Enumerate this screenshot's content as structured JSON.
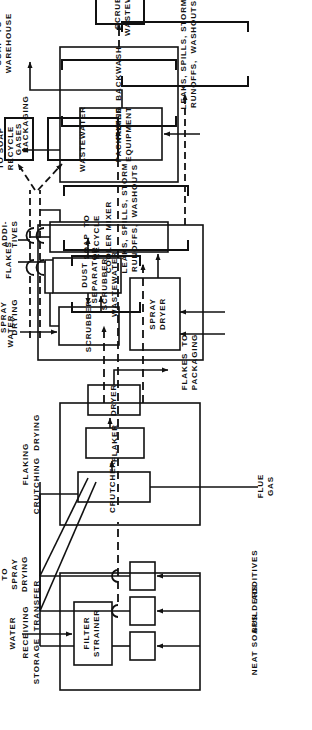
{
  "diagram": {
    "orientation": "rotated-90-ccw",
    "sections": [
      {
        "id": "receiving",
        "label": "RECEIVING\nSTORAGE  TRANSFER"
      },
      {
        "id": "flaking",
        "label": "FLAKING\nCRUTCHING  DRYING"
      },
      {
        "id": "spray",
        "label": "SPRAY\nDRYING"
      },
      {
        "id": "packaging",
        "label": "PACKAGING"
      }
    ],
    "units": [
      {
        "id": "filter-strainer",
        "label": "FILTER\nSTRAINER"
      },
      {
        "id": "tank-neat-soaps",
        "label": ""
      },
      {
        "id": "tank-builders",
        "label": ""
      },
      {
        "id": "tank-additives",
        "label": ""
      },
      {
        "id": "crutcher",
        "label": "CRUTCHER"
      },
      {
        "id": "flaker",
        "label": "FLAKER"
      },
      {
        "id": "dryer",
        "label": "DRYER"
      },
      {
        "id": "spray-dryer",
        "label": "SPRAY\nDRYER"
      },
      {
        "id": "scrubber",
        "label": "SCRUBBER"
      },
      {
        "id": "dust-separator",
        "label": "DUST\nSEPARATOR"
      },
      {
        "id": "cooler-mixer",
        "label": "COOLER MIXER"
      },
      {
        "id": "packaging-equipment",
        "label": "PACKAGING\nEQUIPMENT"
      }
    ],
    "waste_boxes": [
      {
        "id": "filter-backwash",
        "label": "FILTER  BACKWASH",
        "style": "bracket"
      },
      {
        "id": "scrubber-wastewater-flaking",
        "label": "SCRUBBER\nWASTEWATER",
        "style": "bracket"
      },
      {
        "id": "leaks-flaking",
        "label": "LEAKS, SPILLS, STORM\nRUNOFFS,  WASHOUTS",
        "style": "bracket"
      },
      {
        "id": "gases",
        "label": "GASES",
        "style": "solid"
      },
      {
        "id": "wastewater",
        "label": "WASTEWATER",
        "style": "solid"
      },
      {
        "id": "leaks-spray",
        "label": "LEAKS, SPILLS, STORM\nRUNOFFS,  WASHOUTS",
        "style": "bracket"
      },
      {
        "id": "scrubber-wastewater-packaging",
        "label": "SCRUBBER\nWASTEWATER",
        "style": "solid"
      }
    ],
    "stream_labels": [
      {
        "id": "neat-soaps",
        "label": "NEAT SOAPS"
      },
      {
        "id": "builders",
        "label": "BUILDERS"
      },
      {
        "id": "additives-feed",
        "label": "ADDITIVES"
      },
      {
        "id": "water-receiving",
        "label": "WATER"
      },
      {
        "id": "to-spray-drying",
        "label": "TO\nSPRAY\nDRYING"
      },
      {
        "id": "flue-gas",
        "label": "FLUE\nGAS"
      },
      {
        "id": "flakes-to-packaging",
        "label": "FLAKES  TO\nPACKAGING"
      },
      {
        "id": "water-spray",
        "label": "WATER"
      },
      {
        "id": "flakes",
        "label": "FLAKES"
      },
      {
        "id": "additives-mixer",
        "label": "ADDI-\nTIVES"
      },
      {
        "id": "soap-to-recycle",
        "label": "SOAP  TO\nRECYCLE"
      },
      {
        "id": "scrap-to-soap-recycle",
        "label": "SCRAP\nTO SOAP\nRECYCLE"
      },
      {
        "id": "packaged-soap",
        "label": "PACKAGED\nSOAP  TO\nWAREHOUSE"
      }
    ],
    "colors": {
      "line": "#111111",
      "background": "#ffffff",
      "text": "#111111"
    }
  }
}
